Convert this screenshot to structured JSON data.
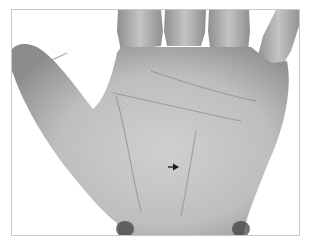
{
  "image": {
    "subject": "palm of a human hand, grayscale photograph",
    "annotation": {
      "type": "arrow",
      "direction": "right",
      "position": {
        "x": 174,
        "y": 166
      }
    },
    "colors": {
      "background": "#ffffff",
      "frame_border": "#c8c8c8",
      "skin_light": "#c9c9c9",
      "skin_mid": "#a8a8a8",
      "skin_dark": "#6e6e6e",
      "arrow": "#1a1a1a"
    }
  },
  "caption": ""
}
